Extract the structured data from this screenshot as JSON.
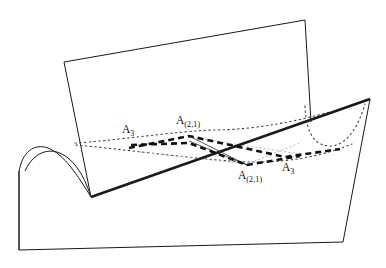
{
  "figure": {
    "title": "",
    "background_color": "#ffffff",
    "stroke_color": "#1a1a1a",
    "faint_stroke_color": "#b8b8b8",
    "width": 386,
    "height": 268
  },
  "labels": {
    "a3_upper_left": {
      "base": "A",
      "sub": "3",
      "x": 122,
      "y": 124
    },
    "a21_upper": {
      "base": "A",
      "sub": "(2,1)",
      "x": 176,
      "y": 115
    },
    "a21_lower": {
      "base": "A",
      "sub": "(2,1)",
      "x": 238,
      "y": 170
    },
    "a3_lower_right": {
      "base": "A",
      "sub": "3",
      "x": 282,
      "y": 162
    }
  },
  "shapes": {
    "base_surface": {
      "name": "curved-base-surface",
      "outline": "M 19 250 L 343 242 L 370 99 L 91 197 Z",
      "bottom_edge": "M 19 250 L 343 242",
      "right_edge": "M 343 242 L 370 99",
      "left_edge": "M 19 250 L 19 171"
    },
    "saddle_hump": {
      "name": "saddle-hump-curve",
      "path": "M 19 250 L 19 172 C 22 152 34 143 48 148 C 64 154 78 176 91 197",
      "inner_path": "M 25 171 C 34 151 52 145 68 158 C 80 168 86 182 91 197"
    },
    "vertical_plane": {
      "name": "vertical-plane",
      "outline": "M 64 62 L 305 20 L 311 122 L 91 197 Z",
      "top_edge": "M 64 62 L 305 20",
      "left_edge": "M 64 62 L 91 197",
      "right_edge": "M 305 20 L 311 122"
    },
    "thick_intersection_line": {
      "name": "plane-intersection-line",
      "path": "M 91 197 L 370 99",
      "width": 2.6
    },
    "right_dip_curve": {
      "name": "right-dotted-dip-curve",
      "path": "M 305 106 C 306 135 316 146 330 146 C 346 146 358 128 365 104"
    },
    "left_dotted_curve": {
      "name": "left-dotted-ridge-curve",
      "path": "M 75 143 C 110 141 180 131 212 130 C 258 130 300 120 330 112"
    },
    "lower_dotted_curve": {
      "name": "lower-dotted-valley-curve",
      "path": "M 76 145 C 120 149 180 157 230 161 C 280 165 320 157 352 144"
    }
  },
  "polylines": {
    "bold_dashed_upper": {
      "name": "bold-dashed-path-upper",
      "path": "M 129 148 L 189 136 L 285 157 L 340 149",
      "dash": "6 4",
      "width": 2.6
    },
    "bold_dashed_lower": {
      "name": "bold-dashed-path-lower",
      "path": "M 131 145 L 189 143 L 247 165 L 300 156",
      "dash": "6 4",
      "width": 2.6
    },
    "thin_solid_v": {
      "name": "thin-solid-connector-v",
      "path": "M 189 136 L 247 165 L 189 141",
      "width": 0.8
    },
    "faint_dotted_x_a": {
      "name": "faint-dotted-crossing-a",
      "path": "M 189 137 L 300 154",
      "dash": "1.2 3"
    },
    "faint_dotted_x_b": {
      "name": "faint-dotted-crossing-b",
      "path": "M 247 164 L 300 143",
      "dash": "1.2 3"
    },
    "faint_dotted_x_c": {
      "name": "faint-dotted-crossing-c",
      "path": "M 140 152 L 247 164",
      "dash": "1.2 3"
    }
  },
  "nodes": {
    "a3_upper_left": {
      "x": 135,
      "y": 146
    },
    "a21_upper": {
      "x": 189,
      "y": 137
    },
    "a21_lower": {
      "x": 247,
      "y": 165
    },
    "a3_lower_right": {
      "x": 285,
      "y": 157
    }
  }
}
